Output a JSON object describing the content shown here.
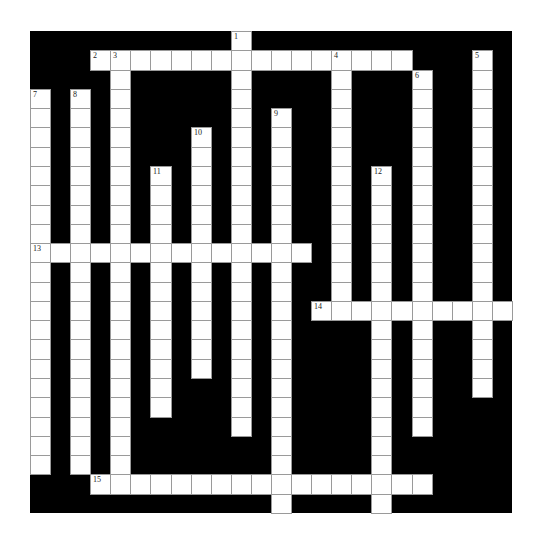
{
  "puzzle": {
    "type": "crossword",
    "grid": {
      "cols": 24,
      "rows": 25,
      "cell_width": 20.08,
      "cell_height": 19.28
    },
    "colors": {
      "block": "#000000",
      "cell": "#ffffff",
      "cell_border": "#9a9a9a",
      "number": "#222222"
    },
    "entries": [
      {
        "number": "1",
        "direction": "down",
        "col": 10,
        "row": 0,
        "length": 21
      },
      {
        "number": "2",
        "direction": "across",
        "col": 3,
        "row": 1,
        "length": 16
      },
      {
        "number": "3",
        "direction": "down",
        "col": 4,
        "row": 1,
        "length": 23
      },
      {
        "number": "4",
        "direction": "down",
        "col": 15,
        "row": 1,
        "length": 14
      },
      {
        "number": "5",
        "direction": "down",
        "col": 22,
        "row": 1,
        "length": 18
      },
      {
        "number": "6",
        "direction": "down",
        "col": 19,
        "row": 2,
        "length": 19
      },
      {
        "number": "7",
        "direction": "down",
        "col": 0,
        "row": 3,
        "length": 20
      },
      {
        "number": "8",
        "direction": "down",
        "col": 2,
        "row": 3,
        "length": 20
      },
      {
        "number": "9",
        "direction": "down",
        "col": 12,
        "row": 4,
        "length": 21
      },
      {
        "number": "10",
        "direction": "down",
        "col": 8,
        "row": 5,
        "length": 13
      },
      {
        "number": "11",
        "direction": "down",
        "col": 6,
        "row": 7,
        "length": 13
      },
      {
        "number": "12",
        "direction": "down",
        "col": 17,
        "row": 7,
        "length": 18
      },
      {
        "number": "13",
        "direction": "across",
        "col": 0,
        "row": 11,
        "length": 14
      },
      {
        "number": "14",
        "direction": "across",
        "col": 14,
        "row": 14,
        "length": 10
      },
      {
        "number": "15",
        "direction": "across",
        "col": 3,
        "row": 23,
        "length": 17
      }
    ]
  }
}
